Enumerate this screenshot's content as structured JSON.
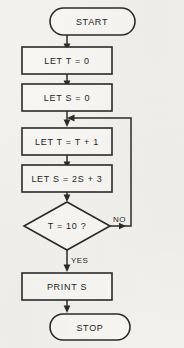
{
  "diagram": {
    "background_color": "#f2f1ed",
    "stroke_color": "#2b2b2a",
    "shape_fill": "#f7f6f3",
    "nodes": [
      {
        "id": "start",
        "shape": "terminator",
        "label": "START"
      },
      {
        "id": "init_t",
        "shape": "process",
        "label": "LET T = 0"
      },
      {
        "id": "init_s",
        "shape": "process",
        "label": "LET S = 0"
      },
      {
        "id": "incr_t",
        "shape": "process",
        "label": "LET T = T + 1"
      },
      {
        "id": "update_s",
        "shape": "process",
        "label": "LET S = 2S + 3"
      },
      {
        "id": "test_t",
        "shape": "decision",
        "label": "T = 10 ?"
      },
      {
        "id": "print_s",
        "shape": "process",
        "label": "PRINT S"
      },
      {
        "id": "stop",
        "shape": "terminator",
        "label": "STOP"
      }
    ],
    "branch_labels": {
      "no": "NO",
      "yes": "YES"
    }
  }
}
